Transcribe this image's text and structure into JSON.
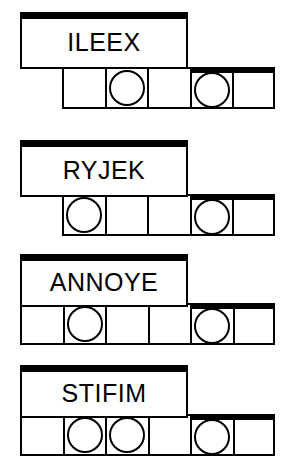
{
  "document": {
    "type": "word-puzzle-worksheet",
    "background_color": "#ffffff",
    "ink_color": "#000000",
    "group_count": 4
  },
  "groups": [
    {
      "id": "group-ileex",
      "word": "ILEEX",
      "letter_count": 5,
      "cell_count": 5,
      "circled_positions": [
        2,
        4
      ],
      "cells": [
        {
          "index": 1,
          "circled": false
        },
        {
          "index": 2,
          "circled": true
        },
        {
          "index": 3,
          "circled": false
        },
        {
          "index": 4,
          "circled": true
        },
        {
          "index": 5,
          "circled": false
        }
      ],
      "geometry": {
        "word_box_left": 20,
        "word_box_top": 12,
        "word_box_width": 168,
        "word_box_height": 57,
        "strip_left": 62,
        "strip_top": 67,
        "thick_top_from_index": 4
      }
    },
    {
      "id": "group-ryjek",
      "word": "RYJEK",
      "letter_count": 5,
      "cell_count": 5,
      "circled_positions": [
        1,
        4
      ],
      "cells": [
        {
          "index": 1,
          "circled": true
        },
        {
          "index": 2,
          "circled": false
        },
        {
          "index": 3,
          "circled": false
        },
        {
          "index": 4,
          "circled": true
        },
        {
          "index": 5,
          "circled": false
        }
      ],
      "geometry": {
        "word_box_left": 20,
        "word_box_top": 140,
        "word_box_width": 168,
        "word_box_height": 57,
        "strip_left": 62,
        "strip_top": 194,
        "thick_top_from_index": 4
      }
    },
    {
      "id": "group-annoye",
      "word": "ANNOYE",
      "letter_count": 6,
      "cell_count": 6,
      "circled_positions": [
        2,
        5
      ],
      "cells": [
        {
          "index": 1,
          "circled": false
        },
        {
          "index": 2,
          "circled": true
        },
        {
          "index": 3,
          "circled": false
        },
        {
          "index": 4,
          "circled": false
        },
        {
          "index": 5,
          "circled": true
        },
        {
          "index": 6,
          "circled": false
        }
      ],
      "geometry": {
        "word_box_left": 20,
        "word_box_top": 254,
        "word_box_width": 168,
        "word_box_height": 53,
        "strip_left": 20,
        "strip_top": 303,
        "thick_top_from_index": 5
      }
    },
    {
      "id": "group-stifim",
      "word": "STIFIM",
      "letter_count": 6,
      "cell_count": 6,
      "circled_positions": [
        2,
        3,
        5
      ],
      "cells": [
        {
          "index": 1,
          "circled": false
        },
        {
          "index": 2,
          "circled": true
        },
        {
          "index": 3,
          "circled": true
        },
        {
          "index": 4,
          "circled": false
        },
        {
          "index": 5,
          "circled": true
        },
        {
          "index": 6,
          "circled": false
        }
      ],
      "geometry": {
        "word_box_left": 20,
        "word_box_top": 365,
        "word_box_width": 168,
        "word_box_height": 53,
        "strip_left": 20,
        "strip_top": 414,
        "thick_top_from_index": 5
      }
    }
  ]
}
